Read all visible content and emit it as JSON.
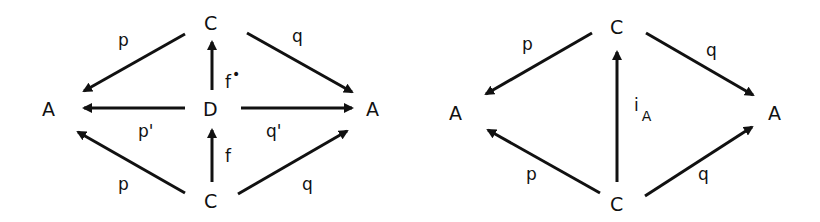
{
  "diagrams": [
    {
      "id": "left",
      "nodes": {
        "top_c": "C",
        "middle_d": "D",
        "bottom_c": "C",
        "left_a": "A",
        "right_a": "A"
      },
      "edges": {
        "top_c_to_left_a": "p",
        "top_c_to_right_a": "q",
        "d_to_left_a": "p'",
        "d_to_right_a": "q'",
        "bottom_c_to_left_a": "p",
        "bottom_c_to_right_a": "q",
        "d_to_top_c": "f",
        "d_to_top_c_sup": "•",
        "bottom_c_to_d": "f"
      }
    },
    {
      "id": "right",
      "nodes": {
        "top_c": "C",
        "bottom_c": "C",
        "left_a": "A",
        "right_a": "A"
      },
      "edges": {
        "top_c_to_left_a": "p",
        "top_c_to_right_a": "q",
        "bottom_c_to_left_a": "p",
        "bottom_c_to_right_a": "q",
        "bottom_c_to_top_c": "i",
        "bottom_c_to_top_c_sub": "A"
      }
    }
  ]
}
